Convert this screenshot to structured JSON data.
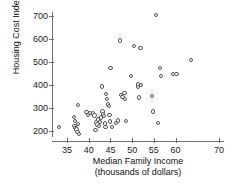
{
  "chart_data": {
    "type": "scatter",
    "title": "",
    "xlabel": "Median Family Income",
    "xlabel_line2": "(thousands of dollars)",
    "ylabel": "Housing Cost Index",
    "xlim": [
      32,
      71
    ],
    "ylim": [
      170,
      730
    ],
    "grid": false,
    "legend": null,
    "xticks": [
      35,
      40,
      45,
      50,
      55,
      60,
      70
    ],
    "xtick_labels": [
      "35",
      "40",
      "45",
      "50",
      "55",
      "60",
      "70"
    ],
    "yticks": [
      200,
      300,
      400,
      500,
      600,
      700
    ],
    "ytick_labels": [
      "200",
      "300",
      "400",
      "500",
      "600",
      "700"
    ],
    "marker": "open-circle",
    "marker_color": "#555555",
    "marker_fill": "#ffffff",
    "n_points": 55,
    "points": [
      [
        33.2,
        218
      ],
      [
        36.6,
        262
      ],
      [
        36.9,
        243
      ],
      [
        36.7,
        222
      ],
      [
        37.0,
        214
      ],
      [
        37.2,
        207
      ],
      [
        37.4,
        196
      ],
      [
        37.6,
        313
      ],
      [
        37.5,
        230
      ],
      [
        37.8,
        188
      ],
      [
        39.5,
        283
      ],
      [
        39.9,
        270
      ],
      [
        40.3,
        279
      ],
      [
        41.0,
        276
      ],
      [
        41.3,
        268
      ],
      [
        41.6,
        205
      ],
      [
        41.8,
        237
      ],
      [
        42.0,
        228
      ],
      [
        42.2,
        250
      ],
      [
        42.4,
        222
      ],
      [
        42.6,
        240
      ],
      [
        42.8,
        258
      ],
      [
        43.0,
        393
      ],
      [
        43.2,
        284
      ],
      [
        43.3,
        271
      ],
      [
        43.5,
        264
      ],
      [
        43.7,
        233
      ],
      [
        43.9,
        218
      ],
      [
        44.0,
        361
      ],
      [
        44.2,
        338
      ],
      [
        44.4,
        315
      ],
      [
        44.6,
        310
      ],
      [
        44.8,
        269
      ],
      [
        44.9,
        242
      ],
      [
        45.0,
        474
      ],
      [
        45.4,
        217
      ],
      [
        46.3,
        236
      ],
      [
        46.8,
        245
      ],
      [
        47.2,
        594
      ],
      [
        47.5,
        357
      ],
      [
        47.8,
        347
      ],
      [
        48.2,
        365
      ],
      [
        48.4,
        338
      ],
      [
        48.6,
        244
      ],
      [
        49.7,
        440
      ],
      [
        50.4,
        569
      ],
      [
        51.3,
        403
      ],
      [
        51.4,
        391
      ],
      [
        51.6,
        345
      ],
      [
        52.0,
        399
      ],
      [
        51.9,
        561
      ],
      [
        54.6,
        351
      ],
      [
        54.8,
        284
      ],
      [
        55.5,
        705
      ],
      [
        56.0,
        236
      ],
      [
        56.4,
        474
      ],
      [
        56.6,
        440
      ],
      [
        59.4,
        447
      ],
      [
        60.2,
        448
      ],
      [
        63.5,
        508
      ]
    ]
  }
}
